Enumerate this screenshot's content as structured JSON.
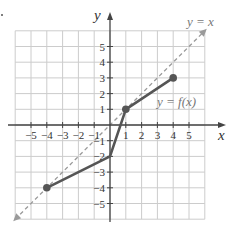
{
  "chart_data": {
    "type": "line",
    "title": "",
    "xlabel": "x",
    "ylabel": "y",
    "xlim": [
      -6,
      6
    ],
    "ylim": [
      -6,
      6
    ],
    "grid": true,
    "x_ticks": [
      -5,
      -4,
      -3,
      -2,
      -1,
      1,
      2,
      3,
      4,
      5
    ],
    "y_ticks": [
      -5,
      -4,
      -3,
      -2,
      -1,
      1,
      2,
      3,
      4,
      5
    ],
    "series": [
      {
        "name": "y = f(x)",
        "style": "solid",
        "color": "#555555",
        "points": [
          [
            -4,
            -4
          ],
          [
            0,
            -2
          ],
          [
            1,
            1
          ],
          [
            4,
            3
          ]
        ],
        "markers": [
          [
            -4,
            -4
          ],
          [
            1,
            1
          ],
          [
            4,
            3
          ]
        ]
      },
      {
        "name": "y = x",
        "style": "dashed",
        "color": "#999999",
        "points": [
          [
            -6,
            -6
          ],
          [
            6,
            6
          ]
        ],
        "arrows": "both"
      }
    ],
    "annotations": [
      {
        "text": "y = x",
        "x": 5.5,
        "y": 7.1
      },
      {
        "text": "y = f(x)",
        "x": 4.2,
        "y": 1.6
      }
    ]
  },
  "labels": {
    "x_axis": "x",
    "y_axis": "y",
    "identity": "y = x",
    "function": "y = f(x)"
  },
  "colors": {
    "grid": "#cccccc",
    "axis": "#444444",
    "function": "#555555",
    "identity": "#9a9a9a"
  }
}
